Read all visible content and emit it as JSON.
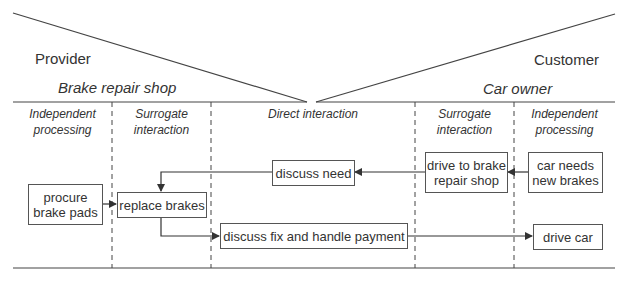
{
  "provider": {
    "role": "Provider",
    "organization": "Brake repair shop"
  },
  "customer": {
    "role": "Customer",
    "organization": "Car owner"
  },
  "lanes": [
    {
      "label": "Independent processing",
      "line1": "Independent",
      "line2": "processing"
    },
    {
      "label": "Surrogate interaction",
      "line1": "Surrogate",
      "line2": "interaction"
    },
    {
      "label": "Direct interaction",
      "line1": "Direct interaction",
      "line2": ""
    },
    {
      "label": "Surrogate interaction",
      "line1": "Surrogate",
      "line2": "interaction"
    },
    {
      "label": "Independent processing",
      "line1": "Independent",
      "line2": "processing"
    }
  ],
  "steps": [
    {
      "id": "procure",
      "line1": "procure",
      "line2": "brake pads"
    },
    {
      "id": "replace",
      "line1": "replace brakes",
      "line2": ""
    },
    {
      "id": "discuss_need",
      "line1": "discuss need",
      "line2": ""
    },
    {
      "id": "discuss_fix",
      "line1": "discuss fix and handle payment",
      "line2": ""
    },
    {
      "id": "drive_to_shop",
      "line1": "drive to brake",
      "line2": "repair shop"
    },
    {
      "id": "car_needs",
      "line1": "car needs",
      "line2": "new brakes"
    },
    {
      "id": "drive_car",
      "line1": "drive car",
      "line2": ""
    }
  ],
  "flows": [
    {
      "from": "car_needs",
      "to": "drive_to_shop"
    },
    {
      "from": "drive_to_shop",
      "to": "discuss_need"
    },
    {
      "from": "discuss_need",
      "to": "replace"
    },
    {
      "from": "procure",
      "to": "replace"
    },
    {
      "from": "replace",
      "to": "discuss_fix"
    },
    {
      "from": "discuss_fix",
      "to": "drive_car"
    }
  ],
  "colors": {
    "line": "#444444",
    "box_border": "#555555",
    "text": "#333333"
  }
}
